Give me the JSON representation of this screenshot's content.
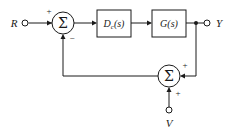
{
  "diagram": {
    "type": "control-system-block-diagram",
    "stroke_color": "#1a1a1a",
    "background_color": "#ffffff",
    "signals": {
      "reference": {
        "label": "R",
        "name": "reference-input",
        "terminal_x": 24,
        "terminal_y": 23
      },
      "output": {
        "label": "Y",
        "name": "output-signal",
        "terminal_x": 208,
        "terminal_y": 23
      },
      "disturbance": {
        "label": "V",
        "name": "disturbance-input",
        "terminal_x": 169,
        "terminal_y": 110
      }
    },
    "blocks": [
      {
        "name": "controller-block",
        "label": "D",
        "subscript": "c",
        "argument": "(s)",
        "full_label": "Dc(s)",
        "x": 97,
        "y": 10,
        "width": 34,
        "height": 27
      },
      {
        "name": "plant-block",
        "label": "G",
        "subscript": "",
        "argument": "(s)",
        "full_label": "G(s)",
        "x": 152,
        "y": 10,
        "width": 34,
        "height": 27
      }
    ],
    "summing_junctions": [
      {
        "name": "error-summing-junction",
        "glyph": "Σ",
        "cx": 63,
        "cy": 23,
        "r": 11,
        "signs": [
          {
            "value": "+",
            "position": "top-left-input",
            "x": 49,
            "y": 12
          },
          {
            "value": "−",
            "position": "bottom-input",
            "x": 71,
            "y": 39
          }
        ]
      },
      {
        "name": "disturbance-summing-junction",
        "glyph": "Σ",
        "cx": 169,
        "cy": 76,
        "r": 11,
        "signs": [
          {
            "value": "+",
            "position": "right-input",
            "x": 183,
            "y": 66
          },
          {
            "value": "+",
            "position": "bottom-input",
            "x": 177,
            "y": 93
          }
        ]
      }
    ],
    "junction_dots": [
      {
        "name": "output-tap-dot",
        "cx": 196,
        "cy": 23,
        "r": 2
      }
    ],
    "wires": [
      {
        "name": "reference-to-sum-wire",
        "path": "M 29 23 L 52 23"
      },
      {
        "name": "sum-to-controller-wire",
        "path": "M 74 23 L 97 23"
      },
      {
        "name": "controller-to-plant-wire",
        "path": "M 131 23 L 152 23"
      },
      {
        "name": "plant-to-output-wire",
        "path": "M 186 23 L 204 23"
      },
      {
        "name": "output-tap-down-wire",
        "path": "M 196 23 L 196 76 L 180 76"
      },
      {
        "name": "feedback-to-error-sum-wire",
        "path": "M 158 76 L 63 76 L 63 34"
      },
      {
        "name": "disturbance-to-sum-wire",
        "path": "M 169 107 L 169 87"
      }
    ]
  }
}
